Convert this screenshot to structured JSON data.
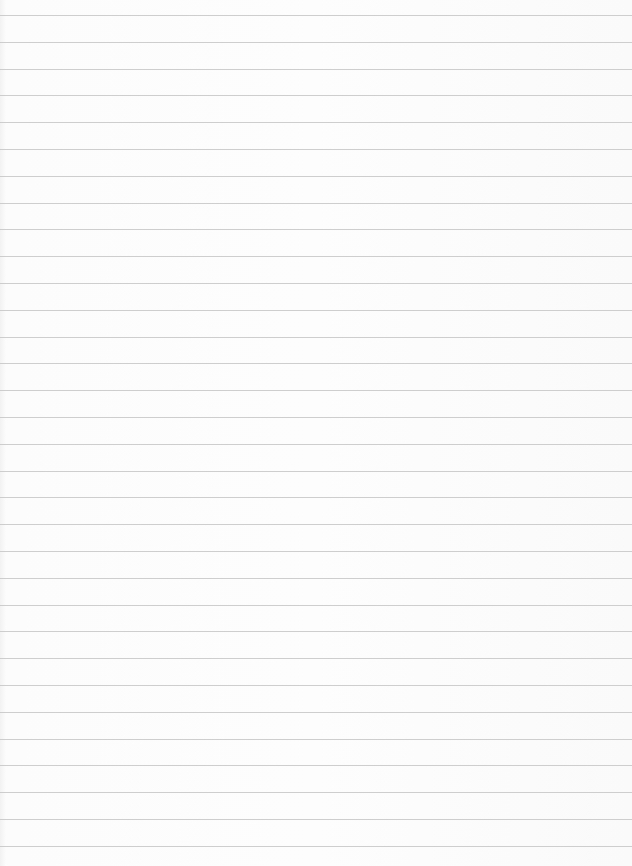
{
  "paper": {
    "type": "lined-sheet",
    "line_color": "#c6c6c6",
    "background": "#fbfbfb",
    "first_line_y": 15,
    "line_spacing": 26.8,
    "line_count": 32
  }
}
